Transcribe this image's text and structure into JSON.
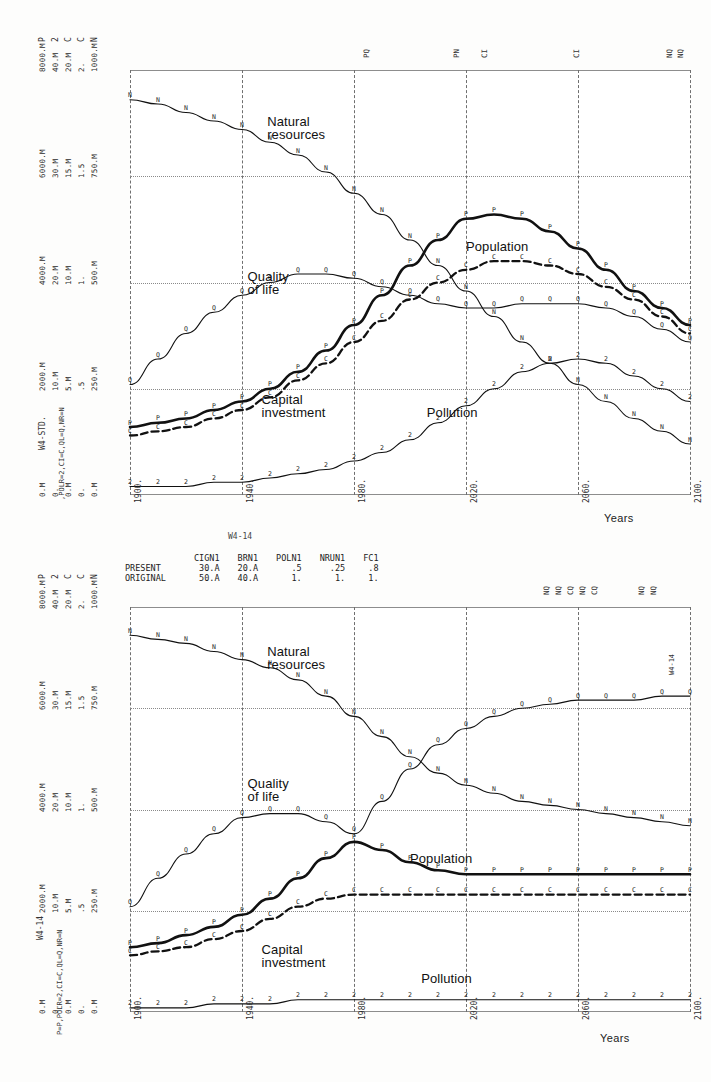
{
  "figure": {
    "caption_between": "W4-14"
  },
  "charts": [
    {
      "id": "top",
      "run_label": "W4-STD.",
      "variable_key": ",POLR=2,CI=C,QL=Q,NR=N",
      "years_label": "Years",
      "x_ticks": [
        "1900.",
        "1940.",
        "1980.",
        "2020.",
        "2060.",
        "2100."
      ],
      "y_header": [
        "P",
        "2",
        "C",
        "C",
        "N"
      ],
      "y_axis_groups": [
        {
          "pos": 1.0,
          "labels": [
            "8000.M",
            "40.M",
            "20.M",
            "2.",
            "1000.M"
          ]
        },
        {
          "pos": 0.75,
          "labels": [
            "6000.M",
            "30.M",
            "15.M",
            "1.5",
            "750.M"
          ]
        },
        {
          "pos": 0.5,
          "labels": [
            "4000.M",
            "20.M",
            "10.M",
            "1.",
            "500.M"
          ]
        },
        {
          "pos": 0.25,
          "labels": [
            "2000.M",
            "10.M",
            "5.M",
            ".5",
            "250.M"
          ]
        },
        {
          "pos": 0.0,
          "labels": [
            "0.M",
            "0.",
            "0.M",
            "0.",
            "0.M"
          ]
        }
      ],
      "mode_marks": [
        {
          "x": 0.415,
          "text": "PQ"
        },
        {
          "x": 0.575,
          "text": "PN"
        },
        {
          "x": 0.625,
          "text": "CI"
        },
        {
          "x": 0.79,
          "text": "CI"
        },
        {
          "x": 0.955,
          "text": "NQ"
        },
        {
          "x": 0.975,
          "text": "NQ"
        }
      ],
      "curve_captions": [
        {
          "text": "Natural\nresources",
          "x": 0.245,
          "y": 0.105
        },
        {
          "text": "Population",
          "x": 0.6,
          "y": 0.4
        },
        {
          "text": "Quality\nof life",
          "x": 0.21,
          "y": 0.47
        },
        {
          "text": "Capital\ninvestment",
          "x": 0.235,
          "y": 0.76
        },
        {
          "text": "Pollution",
          "x": 0.53,
          "y": 0.79
        }
      ]
    },
    {
      "id": "bottom",
      "run_label": "W4-14",
      "variable_key": "P=P,POLR=2,CI=C,QL=Q,NR=N",
      "side_tag": "W4-14",
      "years_label": "Years",
      "x_ticks": [
        "1900.",
        "1940.",
        "1980.",
        "2020.",
        "2060.",
        "2100."
      ],
      "y_header": [
        "P",
        "2",
        "C",
        "C",
        "N"
      ],
      "y_axis_groups": [
        {
          "pos": 1.0,
          "labels": [
            "8000.M",
            "40.M",
            "20.M",
            "2.",
            "1000.M"
          ]
        },
        {
          "pos": 0.75,
          "labels": [
            "6000.M",
            "30.M",
            "15.M",
            "1.5",
            "750.M"
          ]
        },
        {
          "pos": 0.5,
          "labels": [
            "4000.M",
            "20.M",
            "10.M",
            "1.",
            "500.M"
          ]
        },
        {
          "pos": 0.25,
          "labels": [
            "2000.M",
            "10.M",
            "5.M",
            ".5",
            "250.M"
          ]
        },
        {
          "pos": 0.0,
          "labels": [
            "0.M",
            "0.",
            "0.M",
            "0.",
            "0.M"
          ]
        }
      ],
      "mode_marks": [
        {
          "x": 0.735,
          "text": "NQ"
        },
        {
          "x": 0.757,
          "text": "NQ"
        },
        {
          "x": 0.779,
          "text": "CQ"
        },
        {
          "x": 0.8,
          "text": "NQ"
        },
        {
          "x": 0.821,
          "text": "CQ"
        },
        {
          "x": 0.905,
          "text": "NQ"
        },
        {
          "x": 0.927,
          "text": "NQ"
        }
      ],
      "param_table": {
        "columns": [
          "CIGN1",
          "BRN1",
          "POLN1",
          "NRUN1",
          "FC1"
        ],
        "rows": [
          {
            "label": "PRESENT",
            "values": [
              "30.A",
              "20.A",
              ".5",
              ".25",
              ".8"
            ]
          },
          {
            "label": "ORIGINAL",
            "values": [
              "50.A",
              "40.A",
              "1.",
              "1.",
              "1."
            ]
          }
        ]
      },
      "curve_captions": [
        {
          "text": "Natural\nresources",
          "x": 0.245,
          "y": 0.095
        },
        {
          "text": "Quality\nof life",
          "x": 0.21,
          "y": 0.42
        },
        {
          "text": "Population",
          "x": 0.5,
          "y": 0.605
        },
        {
          "text": "Capital\ninvestment",
          "x": 0.235,
          "y": 0.83
        },
        {
          "text": "Pollution",
          "x": 0.52,
          "y": 0.9
        }
      ]
    }
  ],
  "chart_data": [
    {
      "type": "line",
      "title": "World Dynamics standard run (W4-STD.)",
      "xlabel": "Years",
      "ylabel": "",
      "xlim": [
        1900,
        2100
      ],
      "grid": true,
      "legend": "inline curve labels",
      "x": [
        1900,
        1910,
        1920,
        1930,
        1940,
        1950,
        1960,
        1970,
        1980,
        1990,
        2000,
        2010,
        2020,
        2030,
        2040,
        2050,
        2060,
        2070,
        2080,
        2090,
        2100
      ],
      "series": [
        {
          "name": "Natural resources",
          "glyph": "N",
          "units": "1000.M max",
          "values": [
            0.93,
            0.92,
            0.9,
            0.88,
            0.86,
            0.83,
            0.8,
            0.76,
            0.71,
            0.66,
            0.6,
            0.54,
            0.48,
            0.42,
            0.36,
            0.31,
            0.26,
            0.22,
            0.18,
            0.15,
            0.12
          ]
        },
        {
          "name": "Population",
          "glyph": "P",
          "units": "8000.M max",
          "values": [
            0.16,
            0.17,
            0.18,
            0.2,
            0.22,
            0.25,
            0.29,
            0.34,
            0.4,
            0.47,
            0.54,
            0.6,
            0.65,
            0.66,
            0.65,
            0.62,
            0.58,
            0.53,
            0.48,
            0.44,
            0.4
          ]
        },
        {
          "name": "Quality of life",
          "glyph": "Q",
          "units": "2. max",
          "values": [
            0.26,
            0.32,
            0.38,
            0.43,
            0.47,
            0.5,
            0.52,
            0.52,
            0.51,
            0.49,
            0.47,
            0.45,
            0.44,
            0.44,
            0.45,
            0.45,
            0.45,
            0.44,
            0.42,
            0.39,
            0.36
          ]
        },
        {
          "name": "Capital investment",
          "glyph": "C",
          "units": "20.M max",
          "values": [
            0.14,
            0.15,
            0.16,
            0.18,
            0.2,
            0.23,
            0.27,
            0.31,
            0.36,
            0.41,
            0.46,
            0.5,
            0.53,
            0.55,
            0.55,
            0.54,
            0.52,
            0.49,
            0.46,
            0.42,
            0.38
          ]
        },
        {
          "name": "Pollution",
          "glyph": "2",
          "units": "40.M max",
          "values": [
            0.02,
            0.02,
            0.02,
            0.03,
            0.03,
            0.04,
            0.05,
            0.06,
            0.08,
            0.1,
            0.13,
            0.17,
            0.21,
            0.25,
            0.29,
            0.31,
            0.32,
            0.31,
            0.28,
            0.25,
            0.22
          ]
        }
      ]
    },
    {
      "type": "line",
      "title": "World Dynamics run W4-14 (reduced capital-investment generation, birth rate, pollution, resource usage, food)",
      "xlabel": "Years",
      "ylabel": "",
      "xlim": [
        1900,
        2100
      ],
      "grid": true,
      "legend": "inline curve labels",
      "x": [
        1900,
        1910,
        1920,
        1930,
        1940,
        1950,
        1960,
        1970,
        1980,
        1990,
        2000,
        2010,
        2020,
        2030,
        2040,
        2050,
        2060,
        2070,
        2080,
        2090,
        2100
      ],
      "series": [
        {
          "name": "Natural resources",
          "glyph": "N",
          "units": "1000.M max",
          "values": [
            0.93,
            0.92,
            0.91,
            0.89,
            0.87,
            0.85,
            0.82,
            0.78,
            0.73,
            0.68,
            0.63,
            0.59,
            0.56,
            0.54,
            0.52,
            0.51,
            0.5,
            0.49,
            0.48,
            0.47,
            0.46
          ]
        },
        {
          "name": "Quality of life",
          "glyph": "Q",
          "units": "2. max",
          "values": [
            0.26,
            0.33,
            0.39,
            0.44,
            0.48,
            0.49,
            0.49,
            0.47,
            0.44,
            0.52,
            0.6,
            0.66,
            0.7,
            0.73,
            0.75,
            0.76,
            0.77,
            0.77,
            0.77,
            0.78,
            0.78
          ]
        },
        {
          "name": "Population",
          "glyph": "P",
          "units": "8000.M max",
          "values": [
            0.16,
            0.17,
            0.19,
            0.21,
            0.24,
            0.28,
            0.33,
            0.38,
            0.42,
            0.4,
            0.37,
            0.35,
            0.34,
            0.34,
            0.34,
            0.34,
            0.34,
            0.34,
            0.34,
            0.34,
            0.34
          ]
        },
        {
          "name": "Capital investment",
          "glyph": "C",
          "units": "20.M max",
          "values": [
            0.14,
            0.15,
            0.16,
            0.18,
            0.2,
            0.23,
            0.26,
            0.28,
            0.29,
            0.29,
            0.29,
            0.29,
            0.29,
            0.29,
            0.29,
            0.29,
            0.29,
            0.29,
            0.29,
            0.29,
            0.29
          ]
        },
        {
          "name": "Pollution",
          "glyph": "2",
          "units": "40.M max",
          "values": [
            0.01,
            0.01,
            0.01,
            0.02,
            0.02,
            0.02,
            0.03,
            0.03,
            0.03,
            0.03,
            0.03,
            0.03,
            0.03,
            0.03,
            0.03,
            0.03,
            0.03,
            0.03,
            0.03,
            0.03,
            0.03
          ]
        }
      ]
    }
  ]
}
